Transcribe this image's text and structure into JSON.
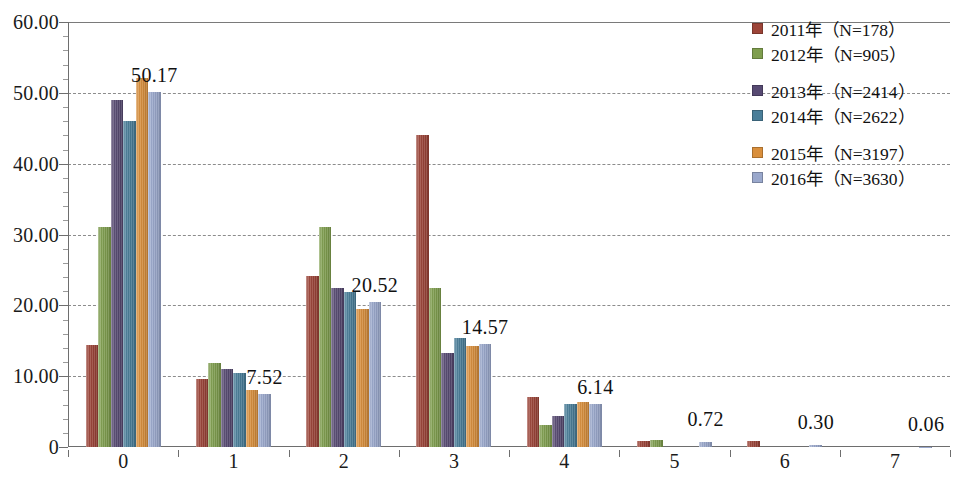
{
  "chart_data": {
    "type": "bar",
    "title": "",
    "xlabel": "",
    "ylabel": "",
    "ylim": [
      0,
      60
    ],
    "ytick_labels": [
      "60.00",
      "50.00",
      "40.00",
      "30.00",
      "20.00",
      "10.00",
      "0"
    ],
    "ytick_values": [
      60,
      50,
      40,
      30,
      20,
      10,
      0
    ],
    "grid": true,
    "grid_style": "dashed-horizontal",
    "legend_position": "top-right",
    "categories": [
      "0",
      "1",
      "2",
      "3",
      "4",
      "5",
      "6",
      "7"
    ],
    "series": [
      {
        "name": "2011年（N=178）",
        "color": "#9c4438",
        "values": [
          14.42,
          9.55,
          24.16,
          44.01,
          7.12,
          0.84,
          0.84,
          0.0
        ]
      },
      {
        "name": "2012年（N=905）",
        "color": "#7f9e4e",
        "values": [
          31.05,
          11.93,
          31.1,
          22.43,
          3.09,
          0.99,
          0.0,
          0.0
        ]
      },
      {
        "name": "2013年（N=2414）",
        "color": "#574a72",
        "values": [
          48.96,
          11.02,
          22.41,
          13.34,
          4.31,
          0.0,
          0.0,
          0.0
        ]
      },
      {
        "name": "2014年（N=2622）",
        "color": "#4a7e99",
        "values": [
          46.03,
          10.45,
          21.89,
          15.37,
          6.03,
          0.0,
          0.0,
          0.0
        ]
      },
      {
        "name": "2015年（N=3197）",
        "color": "#d98f3c",
        "values": [
          52.05,
          7.98,
          19.52,
          14.2,
          6.36,
          0.0,
          0.0,
          0.0
        ]
      },
      {
        "name": "2016年（N=3630）",
        "color": "#9aa8cc",
        "values": [
          50.17,
          7.52,
          20.52,
          14.57,
          6.14,
          0.72,
          0.3,
          0.06
        ]
      }
    ],
    "data_labels": {
      "series": "2016年（N=3630）",
      "values": [
        "50.17",
        "7.52",
        "20.52",
        "14.57",
        "6.14",
        "0.72",
        "0.30",
        "0.06"
      ]
    }
  },
  "legend": {
    "items": [
      {
        "label": "2011年（N=178）",
        "color": "#9c4438"
      },
      {
        "label": "2012年（N=905）",
        "color": "#7f9e4e"
      },
      {
        "label": "2013年（N=2414）",
        "color": "#574a72"
      },
      {
        "label": "2014年（N=2622）",
        "color": "#4a7e99"
      },
      {
        "label": "2015年（N=3197）",
        "color": "#d98f3c"
      },
      {
        "label": "2016年（N=3630）",
        "color": "#9aa8cc"
      }
    ]
  }
}
